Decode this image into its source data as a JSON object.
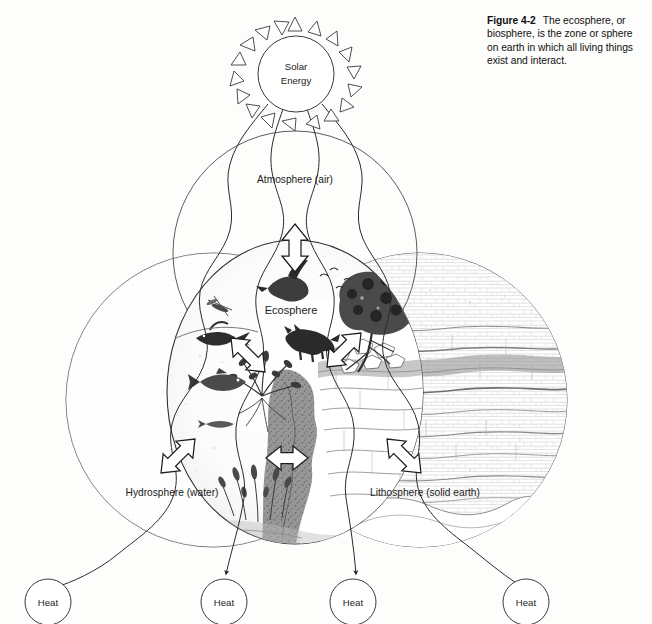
{
  "figure": {
    "number": "Figure 4-2",
    "caption": "The ecosphere, or biosphere, is the zone or sphere on earth in which all living things exist and interact."
  },
  "diagram": {
    "solar": {
      "line1": "Solar",
      "line2": "Energy"
    },
    "spheres": [
      {
        "id": "atmosphere",
        "label": "Atmosphere (air)"
      },
      {
        "id": "hydrosphere",
        "label": "Hydrosphere (water)"
      },
      {
        "id": "lithosphere",
        "label": "Lithosphere (solid earth)"
      },
      {
        "id": "ecosphere",
        "label": "Ecosphere"
      }
    ],
    "heat_outputs": [
      {
        "label": "Heat"
      },
      {
        "label": "Heat"
      },
      {
        "label": "Heat"
      },
      {
        "label": "Heat"
      }
    ],
    "exchange_arrows": [
      {
        "id": "ecosphere-atmosphere",
        "direction": "vertical-double"
      },
      {
        "id": "ecosphere-hydrosphere-upper",
        "direction": "diagonal-double"
      },
      {
        "id": "ecosphere-lithosphere-upper",
        "direction": "diagonal-double"
      },
      {
        "id": "ecosphere-hydrosphere-lower",
        "direction": "diagonal-double"
      },
      {
        "id": "ecosphere-lithosphere-lower",
        "direction": "diagonal-double"
      },
      {
        "id": "ecosphere-core",
        "direction": "horizontal-double"
      }
    ],
    "colors": {
      "ink": "#1b1b1b",
      "outline": "#4a4a4a",
      "paper": "#fdfdfc"
    }
  }
}
